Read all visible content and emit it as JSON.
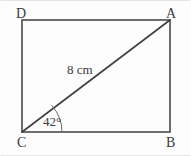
{
  "figure": {
    "type": "rectangle-with-diagonal",
    "background_color": "#fdfdfd",
    "stroke_color": "#4a4a4a",
    "text_color": "#3a3a3a",
    "vertices": [
      {
        "key": "top_left",
        "label": "D",
        "x": 22,
        "y": 20
      },
      {
        "key": "top_right",
        "label": "A",
        "x": 170,
        "y": 20
      },
      {
        "key": "bottom_right",
        "label": "B",
        "x": 170,
        "y": 132
      },
      {
        "key": "bottom_left",
        "label": "C",
        "x": 22,
        "y": 132
      }
    ],
    "diagonal": {
      "from": "C",
      "to": "A",
      "length_label": "8 cm"
    },
    "angle": {
      "at_vertex": "C",
      "between": "CB and CA",
      "value_label": "42°",
      "degrees": 42,
      "arc_radius": 40
    }
  }
}
